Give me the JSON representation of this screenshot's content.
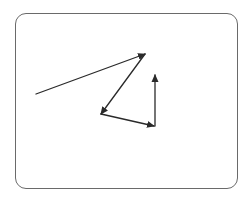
{
  "diagram": {
    "type": "vector-path",
    "frame": {
      "x": 15,
      "y": 13,
      "width": 223,
      "height": 176,
      "radius": 11,
      "stroke": "#6a6a6a"
    },
    "stroke_color": "#2a2a2a",
    "segments": [
      {
        "id": "segment-1",
        "from": [
          36,
          94
        ],
        "to": [
          145,
          54
        ],
        "arrowhead": "end"
      },
      {
        "id": "segment-2",
        "from": [
          145,
          54
        ],
        "to": [
          101,
          114
        ],
        "arrowhead": "end"
      },
      {
        "id": "segment-3",
        "from": [
          101,
          114
        ],
        "to": [
          154,
          126
        ],
        "arrowhead": "end"
      },
      {
        "id": "segment-4",
        "from": [
          155,
          126
        ],
        "to": [
          155,
          75
        ],
        "arrowhead": "end"
      }
    ]
  }
}
